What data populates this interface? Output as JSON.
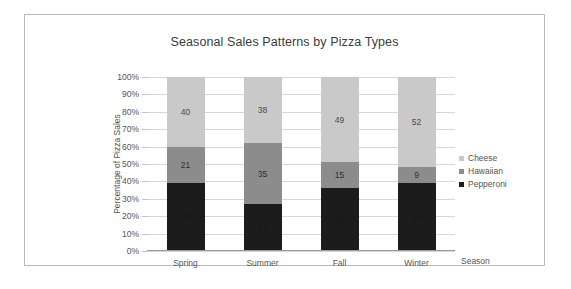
{
  "chart_data": {
    "type": "bar",
    "stacked": true,
    "title": "Seasonal Sales Patterns by Pizza Types",
    "xlabel": "Season",
    "ylabel": "Percentage of Pizza Sales",
    "categories": [
      "Spring",
      "Summer",
      "Fall",
      "Winter"
    ],
    "ylim": [
      0,
      100
    ],
    "yticks": [
      "0%",
      "10%",
      "20%",
      "30%",
      "40%",
      "50%",
      "60%",
      "70%",
      "80%",
      "90%",
      "100%"
    ],
    "ytick_values": [
      0,
      10,
      20,
      30,
      40,
      50,
      60,
      70,
      80,
      90,
      100
    ],
    "grid": true,
    "legend_position": "right",
    "series": [
      {
        "name": "Pepperoni",
        "color": "#1c1c1c",
        "values": [
          39,
          27,
          36,
          39
        ]
      },
      {
        "name": "Hawaiian",
        "color": "#8c8c8c",
        "values": [
          21,
          35,
          15,
          9
        ]
      },
      {
        "name": "Cheese",
        "color": "#c9c9c9",
        "values": [
          40,
          38,
          49,
          52
        ]
      }
    ],
    "stack_order_top_to_bottom": [
      "Cheese",
      "Hawaiian",
      "Pepperoni"
    ]
  }
}
